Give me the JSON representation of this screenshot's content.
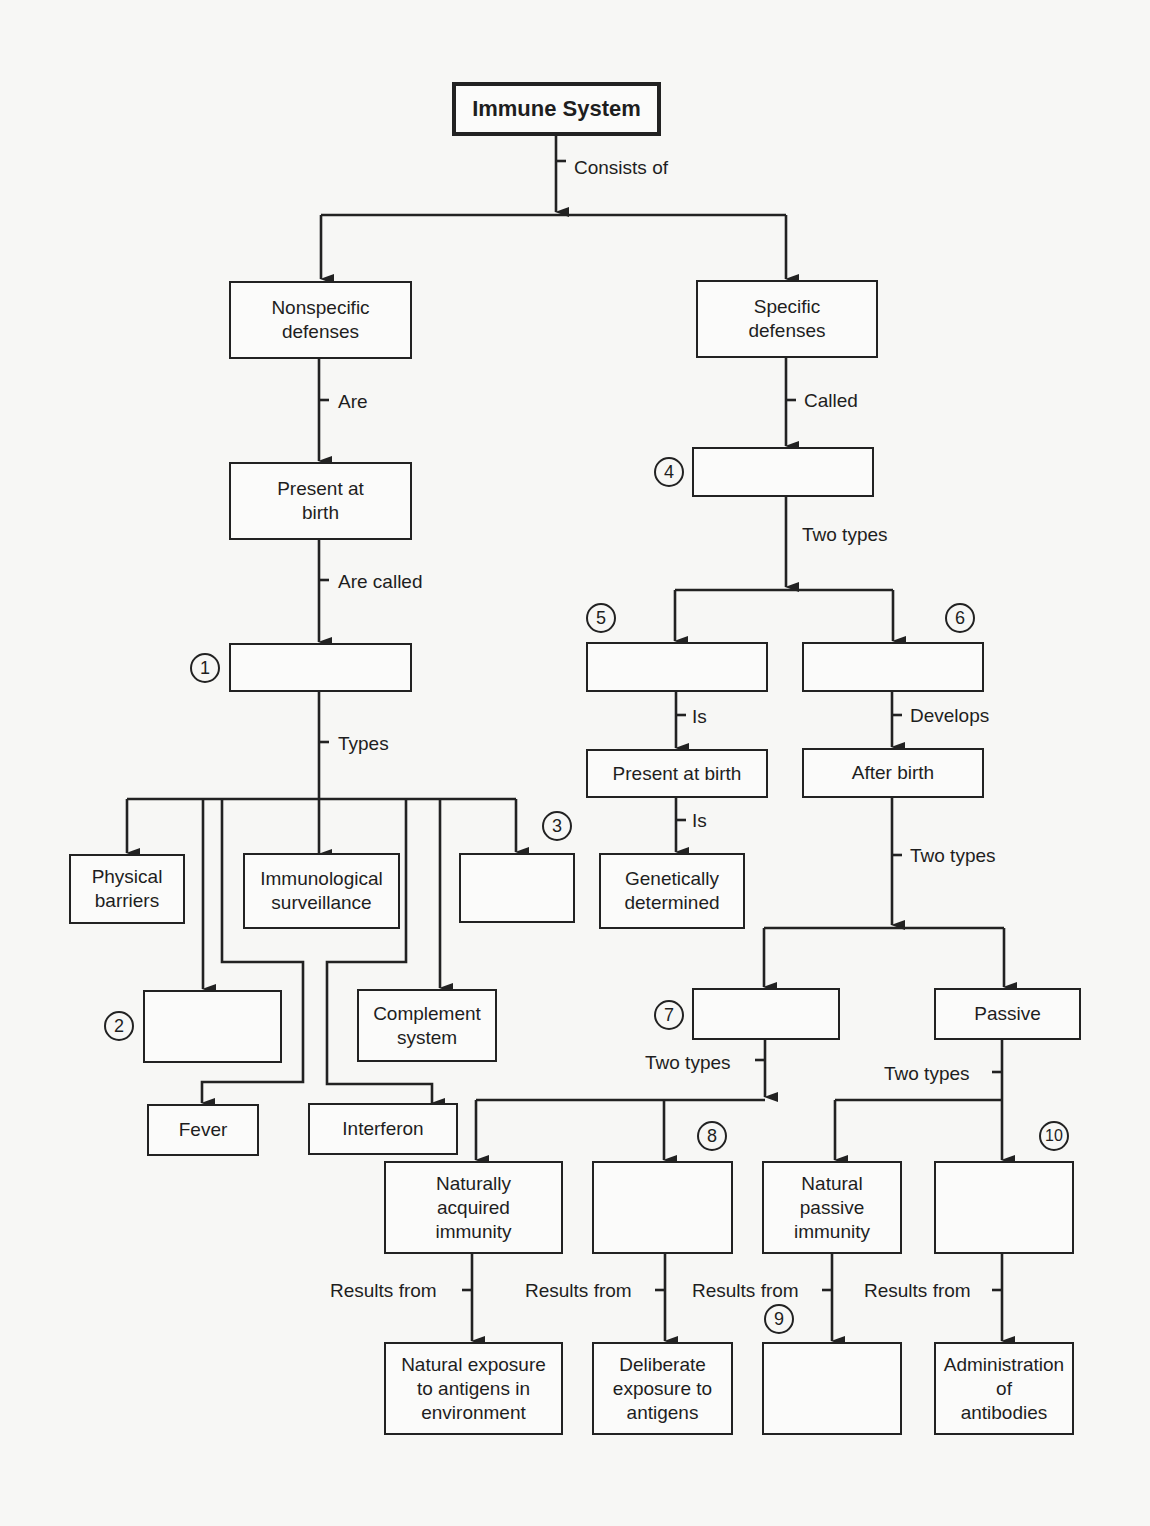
{
  "title": "Immune System",
  "nodes": {
    "root": "Immune System",
    "nonspecific": "Nonspecific\ndefenses",
    "specific": "Specific\ndefenses",
    "present_at_birth_left": "Present at\nbirth",
    "blank_1": "",
    "physical_barriers": "Physical\nbarriers",
    "immunological_surveillance": "Immunological\nsurveillance",
    "blank_3": "",
    "blank_2": "",
    "complement_system": "Complement\nsystem",
    "fever": "Fever",
    "interferon": "Interferon",
    "blank_4": "",
    "blank_5": "",
    "blank_6": "",
    "present_at_birth_right": "Present at birth",
    "after_birth": "After birth",
    "genetically_determined": "Genetically\ndetermined",
    "blank_7": "",
    "passive": "Passive",
    "naturally_acquired": "Naturally\nacquired\nimmunity",
    "blank_8": "",
    "natural_passive": "Natural\npassive\nimmunity",
    "blank_10": "",
    "natural_exposure": "Natural exposure\nto antigens in\nenvironment",
    "deliberate_exposure": "Deliberate\nexposure to\nantigens",
    "blank_9": "",
    "administration_antibodies": "Administration\nof\nantibodies"
  },
  "links": {
    "consists_of": "Consists of",
    "are": "Are",
    "are_called": "Are called",
    "types": "Types",
    "called": "Called",
    "two_types_specific": "Two types",
    "is_1": "Is",
    "is_2": "Is",
    "develops": "Develops",
    "two_types_after_birth": "Two types",
    "two_types_7": "Two types",
    "two_types_passive": "Two types",
    "results_from_1": "Results from",
    "results_from_2": "Results from",
    "results_from_3": "Results from",
    "results_from_4": "Results from"
  },
  "numbers": {
    "n1": "1",
    "n2": "2",
    "n3": "3",
    "n4": "4",
    "n5": "5",
    "n6": "6",
    "n7": "7",
    "n8": "8",
    "n9": "9",
    "n10": "10"
  }
}
